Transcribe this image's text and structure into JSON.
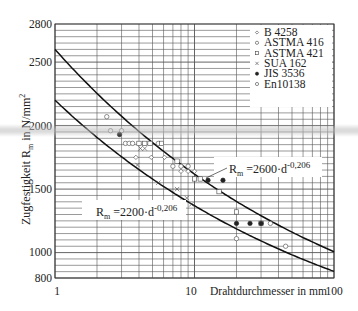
{
  "chart_data": {
    "type": "scatter",
    "title": "",
    "xlabel": "Drahtdurchmesser in mm",
    "ylabel": "Zugfestigkeit R_m in N/mm²",
    "xscale": "log",
    "xlim": [
      1,
      100
    ],
    "ylim": [
      800,
      2800
    ],
    "x_ticks": [
      "1",
      "10",
      "100"
    ],
    "y_ticks": [
      "800",
      "1000",
      "1500",
      "2000",
      "2500",
      "2800"
    ],
    "grid": true,
    "legend_position": "upper right",
    "legend": [
      {
        "label": "B 4258",
        "marker": "diamond-open"
      },
      {
        "label": "ASTMA 416",
        "marker": "circle-open"
      },
      {
        "label": "ASTMA 421",
        "marker": "square-open"
      },
      {
        "label": "SUA 162",
        "marker": "x"
      },
      {
        "label": "JIS 3536",
        "marker": "circle-filled"
      },
      {
        "label": "En10138",
        "marker": "circle-open"
      }
    ],
    "curves": [
      {
        "name": "upper",
        "label": "R_m = 2600·d^-0,206",
        "a": 2600,
        "b": -0.206
      },
      {
        "name": "lower",
        "label": "R_m = 2200·d^-0,206",
        "a": 2200,
        "b": -0.206
      }
    ],
    "series": [
      {
        "name": "B 4258",
        "points": [
          [
            3.8,
            1750
          ],
          [
            4.9,
            1750
          ],
          [
            6.1,
            1750
          ],
          [
            8.0,
            1640
          ],
          [
            9.0,
            1640
          ],
          [
            10.0,
            1640
          ]
        ]
      },
      {
        "name": "ASTMA 416",
        "points": [
          [
            2.5,
            1960
          ],
          [
            3.0,
            1960
          ],
          [
            3.2,
            1860
          ],
          [
            3.4,
            1860
          ],
          [
            3.6,
            1860
          ],
          [
            5.5,
            1860
          ],
          [
            7.0,
            1680
          ],
          [
            8.0,
            1680
          ],
          [
            9.0,
            1680
          ]
        ]
      },
      {
        "name": "ASTMA 421",
        "points": [
          [
            4.0,
            1860
          ],
          [
            4.4,
            1860
          ],
          [
            4.8,
            1860
          ],
          [
            5.8,
            1860
          ],
          [
            7.5,
            1720
          ],
          [
            10.0,
            1580
          ],
          [
            11.0,
            1580
          ],
          [
            15.0,
            1480
          ],
          [
            20.0,
            1320
          ],
          [
            30.0,
            1230
          ]
        ]
      },
      {
        "name": "SUA 162",
        "points": [
          [
            4.1,
            1820
          ],
          [
            4.4,
            1820
          ],
          [
            3.9,
            1690
          ],
          [
            5.5,
            1550
          ],
          [
            7.5,
            1500
          ],
          [
            8.8,
            1430
          ],
          [
            9.5,
            1380
          ]
        ]
      },
      {
        "name": "JIS 3536",
        "points": [
          [
            2.9,
            1930
          ],
          [
            12.5,
            1570
          ],
          [
            20.0,
            1230
          ],
          [
            25.0,
            1230
          ],
          [
            30.0,
            1230
          ],
          [
            16.0,
            1570
          ]
        ]
      },
      {
        "name": "En10138",
        "points": [
          [
            2.35,
            2070
          ],
          [
            35.0,
            1230
          ],
          [
            45.0,
            1050
          ],
          [
            20.0,
            1110
          ]
        ]
      }
    ]
  },
  "axes": {
    "ylabel_text": "Zugfestigkeit R",
    "ylabel_sub": "m",
    "ylabel_tail": " in N/mm",
    "ylabel_sup": "2",
    "xlabel_text": "Drahtdurchmesser in mm",
    "x_tick_1": "1",
    "x_tick_10": "10",
    "x_tick_100": "100",
    "y_tick_2800": "2800",
    "y_tick_2500": "2500",
    "y_tick_2000": "2000",
    "y_tick_1500": "1500",
    "y_tick_1000": "1000",
    "y_tick_800": "800"
  },
  "legend": {
    "items": [
      {
        "label": "B 4258"
      },
      {
        "label": "ASTMA 416"
      },
      {
        "label": "ASTMA 421"
      },
      {
        "label": "SUA 162"
      },
      {
        "label": "JIS 3536"
      },
      {
        "label": "En10138"
      }
    ]
  },
  "annotations": {
    "upper_R": "R",
    "upper_sub": "m",
    "upper_eq": " =2600·d",
    "upper_exp": "-0,206",
    "lower_R": "R",
    "lower_sub": "m",
    "lower_eq": " =2200·d",
    "lower_exp": "-0,206"
  }
}
